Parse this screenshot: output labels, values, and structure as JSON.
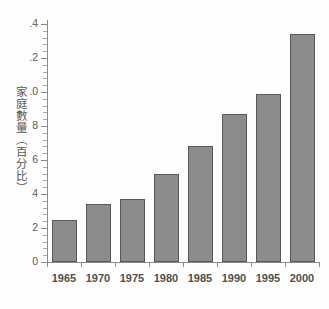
{
  "chart_data": {
    "type": "bar",
    "title": "",
    "xlabel": "",
    "ylabel": "家庭數量（百分比）",
    "categories": [
      "1965",
      "1970",
      "1975",
      "1980",
      "1985",
      "1990",
      "1995",
      "2000"
    ],
    "values": [
      0.25,
      0.34,
      0.37,
      0.52,
      0.68,
      0.87,
      0.99,
      1.34
    ],
    "ylim": [
      0,
      1.4
    ],
    "ytick_labels": [
      ".4",
      ".2",
      ".0",
      "8",
      "6",
      "4",
      "2",
      "0"
    ],
    "ytick_values": [
      1.4,
      1.2,
      1.0,
      0.8,
      0.6,
      0.4,
      0.2,
      0.0
    ],
    "minor_ticks_per_interval": 4,
    "grid": false,
    "legend": null,
    "bar_color": "#8c8c8c",
    "bar_border_color": "#585858",
    "axis_color": "#8a8a8a",
    "background": "#ffffff"
  }
}
